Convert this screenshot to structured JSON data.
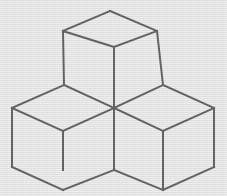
{
  "figure": {
    "kind": "line-art",
    "background_color": "#e9e9e9",
    "stroke_color": "#1a1a1a",
    "stroke_width": 2,
    "canvas": {
      "width": 227,
      "height": 196
    },
    "cube_count": 3,
    "cubes": [
      {
        "name": "top-cube",
        "label": "Top center cube",
        "top_face": "110,11 157,31 114,47 63,31",
        "left_face": "63,31 114,47 114,108 64,85",
        "right_face": "114,47 157,31 163,85 114,108"
      },
      {
        "name": "left-cube",
        "label": "Lower left cube",
        "top_face": "64,85 114,108 114,170 12,108",
        "top_face_poly": "64,85 114,108 63,131 12,108",
        "left_face": "12,108 63,131 63,170 12,167",
        "right_face": "63,131 114,108 114,170 63,170"
      },
      {
        "name": "right-cube",
        "label": "Lower right cube",
        "top_face_poly": "163,85 214,108 163,131 114,108",
        "left_face": "114,108 163,131 163,170 114,170",
        "right_face": "163,131 214,108 214,167 163,170"
      }
    ],
    "edges": [
      {
        "name": "top-cube-top-face-upper-left",
        "x1": 63,
        "y1": 31,
        "x2": 110,
        "y2": 11
      },
      {
        "name": "top-cube-top-face-upper-right",
        "x1": 110,
        "y1": 11,
        "x2": 157,
        "y2": 31
      },
      {
        "name": "top-cube-top-face-lower-left",
        "x1": 63,
        "y1": 31,
        "x2": 114,
        "y2": 47
      },
      {
        "name": "top-cube-top-face-lower-right",
        "x1": 114,
        "y1": 47,
        "x2": 157,
        "y2": 31
      },
      {
        "name": "top-cube-left-vertical",
        "x1": 63,
        "y1": 31,
        "x2": 64,
        "y2": 85
      },
      {
        "name": "top-cube-right-vertical",
        "x1": 157,
        "y1": 31,
        "x2": 163,
        "y2": 85
      },
      {
        "name": "top-cube-center-vertical",
        "x1": 114,
        "y1": 47,
        "x2": 114,
        "y2": 108
      },
      {
        "name": "left-cube-top-back-left",
        "x1": 12,
        "y1": 108,
        "x2": 64,
        "y2": 85
      },
      {
        "name": "left-cube-top-back-right",
        "x1": 64,
        "y1": 85,
        "x2": 114,
        "y2": 108
      },
      {
        "name": "left-cube-top-front-left",
        "x1": 12,
        "y1": 108,
        "x2": 63,
        "y2": 131
      },
      {
        "name": "left-cube-top-front-right",
        "x1": 63,
        "y1": 131,
        "x2": 114,
        "y2": 108
      },
      {
        "name": "left-cube-left-vertical",
        "x1": 12,
        "y1": 108,
        "x2": 12,
        "y2": 167
      },
      {
        "name": "left-cube-front-vertical",
        "x1": 63,
        "y1": 131,
        "x2": 63,
        "y2": 170
      },
      {
        "name": "left-cube-bottom-left",
        "x1": 12,
        "y1": 167,
        "x2": 63,
        "y2": 190
      },
      {
        "name": "left-cube-bottom-right",
        "x1": 63,
        "y1": 190,
        "x2": 114,
        "y2": 170
      },
      {
        "name": "left-cube-right-vertical",
        "x1": 114,
        "y1": 108,
        "x2": 114,
        "y2": 170
      },
      {
        "name": "right-cube-top-back-left",
        "x1": 114,
        "y1": 108,
        "x2": 163,
        "y2": 85
      },
      {
        "name": "right-cube-top-back-right",
        "x1": 163,
        "y1": 85,
        "x2": 214,
        "y2": 108
      },
      {
        "name": "right-cube-top-front-left",
        "x1": 114,
        "y1": 108,
        "x2": 163,
        "y2": 131
      },
      {
        "name": "right-cube-top-front-right",
        "x1": 163,
        "y1": 131,
        "x2": 214,
        "y2": 108
      },
      {
        "name": "right-cube-front-vertical",
        "x1": 163,
        "y1": 131,
        "x2": 163,
        "y2": 190
      },
      {
        "name": "right-cube-right-vertical",
        "x1": 214,
        "y1": 108,
        "x2": 214,
        "y2": 167
      },
      {
        "name": "right-cube-bottom-left",
        "x1": 114,
        "y1": 170,
        "x2": 163,
        "y2": 190
      },
      {
        "name": "right-cube-bottom-right",
        "x1": 163,
        "y1": 190,
        "x2": 214,
        "y2": 167
      }
    ],
    "key_vertices": [
      {
        "name": "top-apex",
        "x": 110,
        "y": 11
      },
      {
        "name": "top-left-corner",
        "x": 63,
        "y": 31
      },
      {
        "name": "top-right-corner",
        "x": 157,
        "y": 31
      },
      {
        "name": "top-face-center",
        "x": 114,
        "y": 47
      },
      {
        "name": "left-shoulder",
        "x": 64,
        "y": 85
      },
      {
        "name": "right-shoulder",
        "x": 163,
        "y": 85
      },
      {
        "name": "central-junction",
        "x": 114,
        "y": 108
      },
      {
        "name": "far-left",
        "x": 12,
        "y": 108
      },
      {
        "name": "far-right",
        "x": 214,
        "y": 108
      },
      {
        "name": "left-front-top",
        "x": 63,
        "y": 131
      },
      {
        "name": "right-front-top",
        "x": 163,
        "y": 131
      },
      {
        "name": "bottom-left",
        "x": 12,
        "y": 167
      },
      {
        "name": "bottom-right",
        "x": 214,
        "y": 167
      },
      {
        "name": "bottom-center-notch",
        "x": 114,
        "y": 170
      },
      {
        "name": "bottom-left-front",
        "x": 63,
        "y": 190
      },
      {
        "name": "bottom-right-front",
        "x": 163,
        "y": 190
      }
    ]
  }
}
